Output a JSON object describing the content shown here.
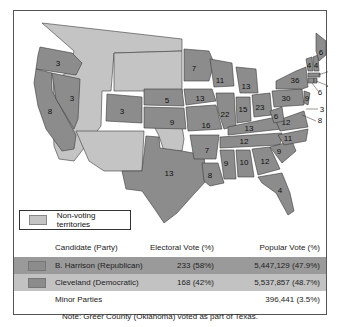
{
  "map": {
    "title": "1888 U.S. Presidential Election",
    "legend": {
      "label": "Non-voting territories",
      "color": "#c4c4c4"
    },
    "state_color": "#8c8c8c",
    "states": [
      {
        "id": "WA",
        "ev": ""
      },
      {
        "id": "OR",
        "ev": "3"
      },
      {
        "id": "CA",
        "ev": "8"
      },
      {
        "id": "NV",
        "ev": "3"
      },
      {
        "id": "CO",
        "ev": "3"
      },
      {
        "id": "NE",
        "ev": "5"
      },
      {
        "id": "KS",
        "ev": "9"
      },
      {
        "id": "TX",
        "ev": "13"
      },
      {
        "id": "MN",
        "ev": "7"
      },
      {
        "id": "IA",
        "ev": "13"
      },
      {
        "id": "MO",
        "ev": "16"
      },
      {
        "id": "AR",
        "ev": "7"
      },
      {
        "id": "LA",
        "ev": "8"
      },
      {
        "id": "WI",
        "ev": "11"
      },
      {
        "id": "IL",
        "ev": "22"
      },
      {
        "id": "MI",
        "ev": "13"
      },
      {
        "id": "IN",
        "ev": "15"
      },
      {
        "id": "OH",
        "ev": "23"
      },
      {
        "id": "KY",
        "ev": "13"
      },
      {
        "id": "TN",
        "ev": "12"
      },
      {
        "id": "MS",
        "ev": "9"
      },
      {
        "id": "AL",
        "ev": "10"
      },
      {
        "id": "GA",
        "ev": "12"
      },
      {
        "id": "FL",
        "ev": "4"
      },
      {
        "id": "SC",
        "ev": "9"
      },
      {
        "id": "NC",
        "ev": "11"
      },
      {
        "id": "VA",
        "ev": "12"
      },
      {
        "id": "WV",
        "ev": "6"
      },
      {
        "id": "PA",
        "ev": "30"
      },
      {
        "id": "NY",
        "ev": "36"
      },
      {
        "id": "NJ",
        "ev": "9"
      },
      {
        "id": "DE",
        "ev": "3"
      },
      {
        "id": "MD",
        "ev": "8"
      },
      {
        "id": "VT",
        "ev": "4"
      },
      {
        "id": "NH",
        "ev": "4"
      },
      {
        "id": "ME",
        "ev": "6"
      },
      {
        "id": "MA",
        "ev": "14"
      },
      {
        "id": "RI",
        "ev": "4"
      },
      {
        "id": "CT",
        "ev": "6"
      }
    ]
  },
  "table": {
    "headers": {
      "candidate": "Candidate (Party)",
      "electoral": "Electoral Vote (%)",
      "popular": "Popular Vote (%)"
    },
    "rows": [
      {
        "candidate": "B. Harrison (Republican)",
        "electoral": "233 (58%)",
        "popular": "5,447,129 (47.9%)",
        "color": "#9a9a9a"
      },
      {
        "candidate": "Cleveland (Democratic)",
        "electoral": "168 (42%)",
        "popular": "5,537,857 (48.7%)",
        "color": "#c2c2c2"
      },
      {
        "candidate": "Minor Parties",
        "electoral": "",
        "popular": "396,441 (3.5%)"
      }
    ],
    "note": "Note: Greer County (Oklahoma) voted as part of Texas."
  }
}
